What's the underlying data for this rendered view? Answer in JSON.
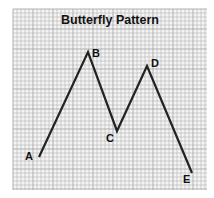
{
  "title": "Butterfly Pattern",
  "points": [
    {
      "label": "A",
      "x": 39,
      "y": 157,
      "lx": 25,
      "ly": 160
    },
    {
      "label": "B",
      "x": 88,
      "y": 52,
      "lx": 92,
      "ly": 57
    },
    {
      "label": "C",
      "x": 117,
      "y": 131,
      "lx": 106,
      "ly": 142
    },
    {
      "label": "D",
      "x": 147,
      "y": 66,
      "lx": 151,
      "ly": 67
    },
    {
      "label": "E",
      "x": 192,
      "y": 173,
      "lx": 183,
      "ly": 183
    }
  ],
  "colors": {
    "grid": "#a8a8a8",
    "line": "#222222",
    "text": "#111111"
  }
}
